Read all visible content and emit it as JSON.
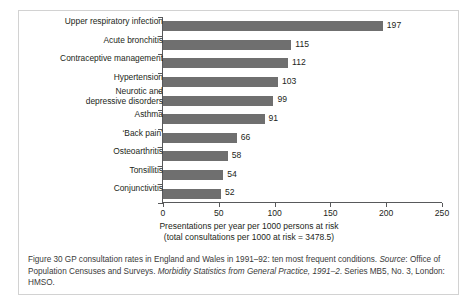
{
  "chart_data": {
    "type": "bar",
    "orientation": "horizontal",
    "title": "",
    "xlabel_line1": "Presentations per year per 1000 persons at risk",
    "xlabel_line2": "(total consultations per 1000 at risk = 3478.5)",
    "ylabel": "",
    "xlim": [
      0,
      250
    ],
    "xticks": [
      0,
      50,
      100,
      150,
      200,
      250
    ],
    "xtick_labels": [
      "0",
      "50",
      "100",
      "150",
      "200",
      "250"
    ],
    "grid": false,
    "legend": null,
    "bar_color": "#6f6f6f",
    "axis_color": "#58595b",
    "categories": [
      "Upper respiratory infection",
      "Acute bronchitis",
      "Contraceptive management",
      "Hypertension",
      "Neurotic and\ndepressive disorders",
      "Asthma",
      "‘Back pain’",
      "Osteoarthritis",
      "Tonsillitis",
      "Conjunctivitis"
    ],
    "values": [
      197,
      115,
      112,
      103,
      99,
      91,
      66,
      58,
      54,
      52
    ],
    "value_labels": [
      "197",
      "115",
      "112",
      "103",
      "99",
      "91",
      "66",
      "58",
      "54",
      "52"
    ]
  },
  "caption": {
    "line1_plain": "Figure 30  GP consultation rates in England and Wales in 1991–92: ten most frequent conditions.",
    "line2_italic_a": "Source",
    "line2_plain_a": ": Office of Population Censuses and Surveys. ",
    "line2_italic_b": "Morbidity Statistics from General Practice,",
    "line3_italic_c": "1991–2",
    "line3_plain_b": ". Series MB5, No. 3, London: HMSO."
  }
}
